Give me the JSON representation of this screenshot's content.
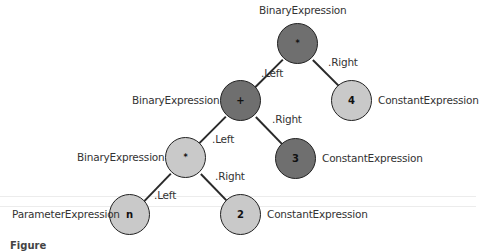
{
  "diagram": {
    "colors": {
      "binary_node_fill": "#6f6f6f",
      "light_node_fill": "#c9c9c9",
      "stroke": "#222222",
      "text": "#333333"
    },
    "nodes": [
      {
        "id": "root",
        "symbol": "*",
        "type_label": "BinaryExpression",
        "style": "dark",
        "cx": 298,
        "cy": 44,
        "label_pos": "top"
      },
      {
        "id": "plus",
        "symbol": "+",
        "type_label": "BinaryExpression",
        "style": "dark",
        "cx": 241,
        "cy": 101,
        "label_pos": "left"
      },
      {
        "id": "four",
        "symbol": "4",
        "type_label": "ConstantExpression",
        "style": "light",
        "cx": 352,
        "cy": 101,
        "label_pos": "right"
      },
      {
        "id": "mult",
        "symbol": "*",
        "type_label": "BinaryExpression",
        "style": "light",
        "cx": 186,
        "cy": 158,
        "label_pos": "left"
      },
      {
        "id": "three",
        "symbol": "3",
        "type_label": "ConstantExpression",
        "style": "dark",
        "cx": 296,
        "cy": 159,
        "label_pos": "right"
      },
      {
        "id": "n",
        "symbol": "n",
        "type_label": "ParameterExpression",
        "style": "light",
        "cx": 130,
        "cy": 215,
        "label_pos": "left"
      },
      {
        "id": "two",
        "symbol": "2",
        "type_label": "ConstantExpression",
        "style": "light",
        "cx": 241,
        "cy": 215,
        "label_pos": "right"
      }
    ],
    "edges": [
      {
        "from": "root",
        "to": "plus",
        "label": ".Left"
      },
      {
        "from": "root",
        "to": "four",
        "label": ".Right"
      },
      {
        "from": "plus",
        "to": "mult",
        "label": ".Left"
      },
      {
        "from": "plus",
        "to": "three",
        "label": ".Right"
      },
      {
        "from": "mult",
        "to": "n",
        "label": ".Left"
      },
      {
        "from": "mult",
        "to": "two",
        "label": ".Right"
      }
    ],
    "caption": "Figure"
  }
}
